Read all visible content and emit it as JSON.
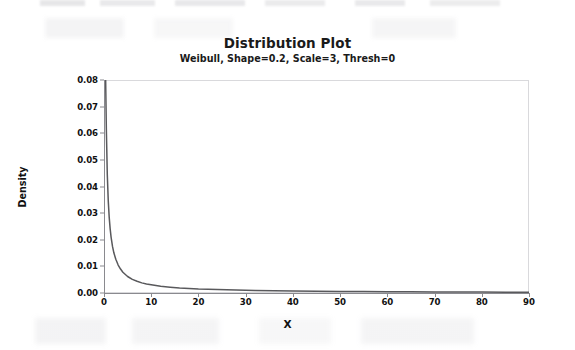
{
  "chart_data": {
    "type": "line",
    "title": "Distribution Plot",
    "subtitle": "Weibull, Shape=0.2, Scale=3, Thresh=0",
    "xlabel": "X",
    "ylabel": "Density",
    "xlim": [
      0,
      90
    ],
    "ylim": [
      0.0,
      0.08
    ],
    "grid": false,
    "legend": null,
    "distribution": {
      "family": "Weibull",
      "shape": 0.2,
      "scale": 3,
      "threshold": 0
    },
    "xticks": [
      0,
      10,
      20,
      30,
      40,
      50,
      60,
      70,
      80,
      90
    ],
    "xtick_labels": [
      "0",
      "10",
      "20",
      "30",
      "40",
      "50",
      "60",
      "70",
      "80",
      "90"
    ],
    "yticks": [
      0.0,
      0.01,
      0.02,
      0.03,
      0.04,
      0.05,
      0.06,
      0.07,
      0.08
    ],
    "ytick_labels": [
      "0.00",
      "0.01",
      "0.02",
      "0.03",
      "0.04",
      "0.05",
      "0.06",
      "0.07",
      "0.08"
    ],
    "series": [
      {
        "name": "Weibull PDF (Shape=0.2, Scale=3, Thresh=0)",
        "color": "#59595c",
        "x": [
          0.35,
          0.5,
          0.7,
          0.9,
          1.1,
          1.3,
          1.5,
          1.8,
          2.1,
          2.5,
          3.0,
          3.5,
          4.0,
          5.0,
          6.0,
          7.0,
          8.0,
          9.0,
          10.0,
          12.0,
          14.0,
          16.0,
          18.0,
          20.0,
          24.0,
          28.0,
          32.0,
          36.0,
          40.0,
          45.0,
          50.0,
          55.0,
          60.0,
          65.0,
          70.0,
          75.0,
          80.0,
          85.0,
          90.0
        ],
        "y": [
          0.08,
          0.0612,
          0.0443,
          0.0347,
          0.0285,
          0.0242,
          0.021,
          0.0175,
          0.015,
          0.0127,
          0.0105,
          0.009,
          0.0078,
          0.0062,
          0.0051,
          0.0044,
          0.0038,
          0.0034,
          0.0031,
          0.0025,
          0.0022,
          0.0019,
          0.0017,
          0.0015,
          0.0013,
          0.0011,
          0.00095,
          0.00085,
          0.00076,
          0.00067,
          0.00059,
          0.00053,
          0.00048,
          0.00044,
          0.0004,
          0.00037,
          0.00034,
          0.00032,
          0.0003
        ]
      }
    ]
  },
  "axes": {
    "y_axis_title": "Density",
    "x_axis_title": "X"
  },
  "colors": {
    "curve": "#59595c",
    "axis": "#8a8a8f",
    "frame": "#d9d9dc",
    "text": "#1a1a1a",
    "background": "#ffffff"
  }
}
